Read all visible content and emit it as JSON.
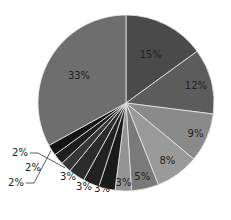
{
  "chart_data": {
    "type": "pie",
    "title": "",
    "start_angle": "12 o'clock",
    "direction": "clockwise",
    "categories": [
      "Slice 1",
      "Slice 2",
      "Slice 3",
      "Slice 4",
      "Slice 5",
      "Slice 6",
      "Slice 7",
      "Slice 8",
      "Slice 9",
      "Slice 10",
      "Slice 11",
      "Slice 12",
      "Slice 13"
    ],
    "values": [
      15,
      12,
      9,
      8,
      5,
      3,
      3,
      3,
      3,
      2,
      2,
      2,
      33
    ],
    "labels": [
      "15%",
      "12%",
      "9%",
      "8%",
      "5%",
      "3%",
      "3%",
      "3%",
      "3%",
      "2%",
      "2%",
      "2%",
      "33%"
    ],
    "colors": [
      "#4a4a4a",
      "#5c5c5c",
      "#8a8a8a",
      "#9a9a9a",
      "#7a7a7a",
      "#939393",
      "#1a1a1a",
      "#222222",
      "#2c2c2c",
      "#363636",
      "#1e1e1e",
      "#141414",
      "#6e6e6e"
    ],
    "legend": "none"
  }
}
